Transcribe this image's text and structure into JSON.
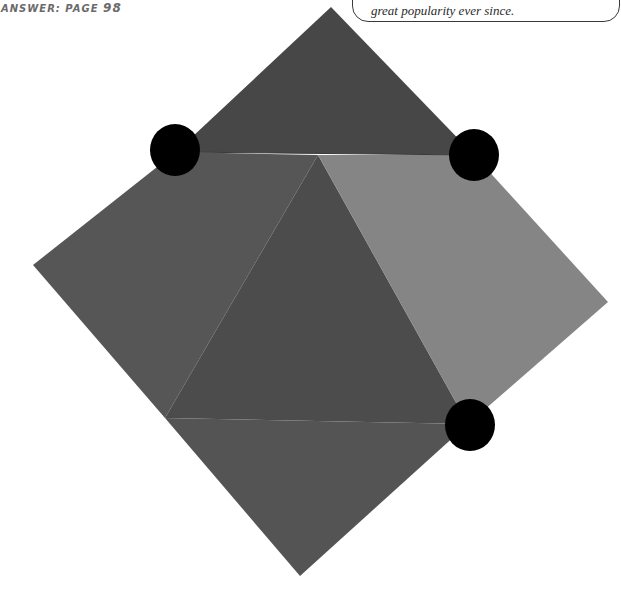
{
  "header": {
    "answer_prefix": "ANSWER:",
    "answer_page_label": "PAGE",
    "answer_page_number": "98"
  },
  "callout": {
    "text": "great popularity ever since."
  },
  "puzzle": {
    "shape": "folded square with triangular flaps",
    "pieces": [
      {
        "name": "top-flap",
        "color": "#474747"
      },
      {
        "name": "left-panel",
        "color": "#565656"
      },
      {
        "name": "center-triangle",
        "color": "#4c4c4c"
      },
      {
        "name": "right-panel",
        "color": "#858585"
      },
      {
        "name": "bottom-panel",
        "color": "#545454"
      }
    ],
    "dots": [
      {
        "name": "dot-top-left",
        "color": "#000000"
      },
      {
        "name": "dot-top-right",
        "color": "#000000"
      },
      {
        "name": "dot-bottom-right",
        "color": "#000000"
      }
    ]
  }
}
